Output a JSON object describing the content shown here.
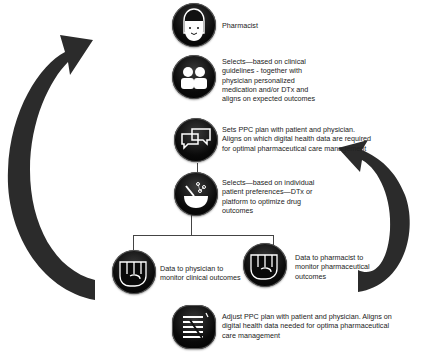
{
  "diagram": {
    "steps": [
      {
        "id": "pharmacist",
        "icon": "person-face-icon",
        "text": "Pharmacist"
      },
      {
        "id": "selects-clinical",
        "icon": "two-people-icon",
        "text_lines": [
          "Selects—based on clinical",
          "guidelines - together with",
          "physician personalized",
          "medication and/or DTx and",
          "aligns on expected outcomes"
        ]
      },
      {
        "id": "sets-ppc-plan",
        "icon": "speech-bubbles-icon",
        "text_lines": [
          "Sets PPC plan with patient and physician.",
          "Aligns on which digital health data are required",
          "for optimal pharmaceutical care management"
        ]
      },
      {
        "id": "selects-preferences",
        "icon": "bowl-network-icon",
        "text_lines": [
          "Selects—based on individual",
          "patient preferences—DTx or",
          "platform to optimize drug",
          "outcomes"
        ]
      },
      {
        "id": "data-physician",
        "icon": "fist-icon",
        "text_lines": [
          "Data to physician to",
          "monitor clinical outcomes"
        ]
      },
      {
        "id": "data-pharmacist",
        "icon": "fist-icon",
        "text_lines": [
          "Data to pharmacist to",
          "monitor pharmaceutical",
          "outcomes"
        ]
      },
      {
        "id": "adjust-ppc-plan",
        "icon": "checklist-icon",
        "text_lines": [
          "Adjust PPC plan with patient and physician. Aligns on",
          "digital health data needed for optima pharmaceutical",
          "care management"
        ]
      }
    ],
    "arrows": [
      {
        "id": "left-cycle-arrow",
        "direction": "up-right",
        "color": "#2b2b2b"
      },
      {
        "id": "right-cycle-arrow",
        "direction": "up-left",
        "color": "#2b2b2b"
      }
    ]
  }
}
